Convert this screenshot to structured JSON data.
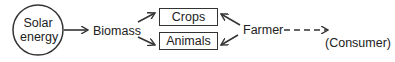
{
  "diagram": {
    "source": {
      "line1": "Solar",
      "line2": "energy"
    },
    "biomass": "Biomass",
    "outputs": [
      {
        "label": "Crops"
      },
      {
        "label": "Animals"
      }
    ],
    "farmer": "Farmer",
    "consumer": "(Consumer)"
  }
}
